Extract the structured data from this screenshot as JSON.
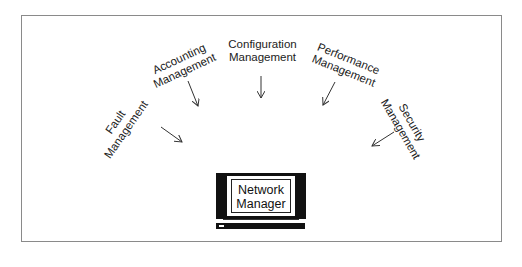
{
  "diagram": {
    "center_node": {
      "line1": "Network",
      "line2": "Manager",
      "icon": "computer-monitor-icon"
    },
    "areas": [
      {
        "line1": "Fault",
        "line2": "Management"
      },
      {
        "line1": "Accounting",
        "line2": "Management"
      },
      {
        "line1": "Configuration",
        "line2": "Management"
      },
      {
        "line1": "Performance",
        "line2": "Management"
      },
      {
        "line1": "Security",
        "line2": "Management"
      }
    ],
    "colors": {
      "line": "#222222",
      "frame": "#8a8a8a",
      "background": "#ffffff"
    }
  }
}
